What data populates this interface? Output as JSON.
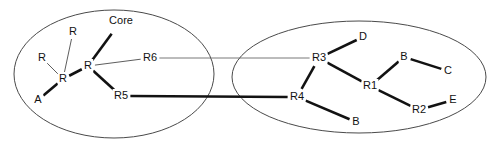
{
  "diagram": {
    "type": "molecular-fragment-graph",
    "title": "",
    "background_color": "#ffffff",
    "line_color": "#121212",
    "outline_color": "#4a4a4a",
    "clusters": [
      {
        "id": "left-cluster",
        "name": "left-fragment",
        "cx": 114,
        "cy": 74,
        "rx": 100,
        "ry": 64
      },
      {
        "id": "right-cluster",
        "name": "right-fragment",
        "cx": 359,
        "cy": 77,
        "rx": 127,
        "ry": 56
      }
    ],
    "nodes": [
      {
        "id": "L_R_top",
        "label": "R",
        "x": 73,
        "y": 32,
        "cluster": "left-cluster"
      },
      {
        "id": "L_Core",
        "label": "Core",
        "x": 121,
        "y": 21,
        "cluster": "left-cluster"
      },
      {
        "id": "L_R_left",
        "label": "R",
        "x": 42,
        "y": 58,
        "cluster": "left-cluster"
      },
      {
        "id": "L_R_center",
        "label": "R",
        "x": 63,
        "y": 79,
        "cluster": "left-cluster"
      },
      {
        "id": "L_R_main",
        "label": "R",
        "x": 88,
        "y": 66,
        "cluster": "left-cluster"
      },
      {
        "id": "L_A",
        "label": "A",
        "x": 38,
        "y": 100,
        "cluster": "left-cluster"
      },
      {
        "id": "L_R6",
        "label": "R6",
        "x": 150,
        "y": 58,
        "cluster": "left-cluster"
      },
      {
        "id": "L_R5",
        "label": "R5",
        "x": 121,
        "y": 96,
        "cluster": "left-cluster"
      },
      {
        "id": "R_R3",
        "label": "R3",
        "x": 319,
        "y": 58,
        "cluster": "right-cluster"
      },
      {
        "id": "R_D",
        "label": "D",
        "x": 363,
        "y": 37,
        "cluster": "right-cluster"
      },
      {
        "id": "R_R1",
        "label": "R1",
        "x": 370,
        "y": 86,
        "cluster": "right-cluster"
      },
      {
        "id": "R_B_top",
        "label": "B",
        "x": 404,
        "y": 57,
        "cluster": "right-cluster"
      },
      {
        "id": "R_C",
        "label": "C",
        "x": 448,
        "y": 71,
        "cluster": "right-cluster"
      },
      {
        "id": "R_R2",
        "label": "R2",
        "x": 419,
        "y": 110,
        "cluster": "right-cluster"
      },
      {
        "id": "R_E",
        "label": "E",
        "x": 453,
        "y": 100,
        "cluster": "right-cluster"
      },
      {
        "id": "R_R4",
        "label": "R4",
        "x": 297,
        "y": 97,
        "cluster": "right-cluster"
      },
      {
        "id": "R_B_bottom",
        "label": "B",
        "x": 356,
        "y": 122,
        "cluster": "right-cluster"
      }
    ],
    "edges": [
      {
        "from": "L_R_left",
        "to": "L_R_center",
        "style": "thin"
      },
      {
        "from": "L_R_top",
        "to": "L_R_center",
        "style": "thin"
      },
      {
        "from": "L_A",
        "to": "L_R_center",
        "style": "thick"
      },
      {
        "from": "L_R_center",
        "to": "L_R_main",
        "style": "thick"
      },
      {
        "from": "L_Core",
        "to": "L_R_main",
        "style": "thick"
      },
      {
        "from": "L_R_main",
        "to": "L_R6",
        "style": "thin"
      },
      {
        "from": "L_R_main",
        "to": "L_R5",
        "style": "thick"
      },
      {
        "from": "L_R6",
        "to": "R_R3",
        "style": "link-thin"
      },
      {
        "from": "L_R5",
        "to": "R_R4",
        "style": "link"
      },
      {
        "from": "R_R3",
        "to": "R_D",
        "style": "thick"
      },
      {
        "from": "R_R3",
        "to": "R_R1",
        "style": "thick"
      },
      {
        "from": "R_R3",
        "to": "R_R4",
        "style": "thick"
      },
      {
        "from": "R_R1",
        "to": "R_B_top",
        "style": "thick"
      },
      {
        "from": "R_B_top",
        "to": "R_C",
        "style": "thick"
      },
      {
        "from": "R_R1",
        "to": "R_R2",
        "style": "thick"
      },
      {
        "from": "R_R2",
        "to": "R_E",
        "style": "thick"
      },
      {
        "from": "R_R4",
        "to": "R_B_bottom",
        "style": "thick"
      }
    ]
  }
}
